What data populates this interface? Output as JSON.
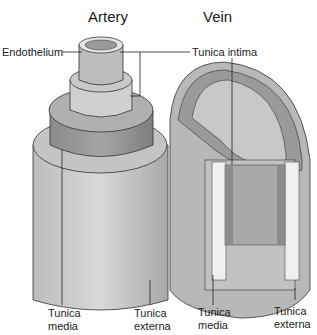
{
  "titles": {
    "artery": "Artery",
    "vein": "Vein"
  },
  "labels": {
    "endothelium": "Endothelium",
    "tunica_intima": "Tunica intima",
    "artery_media": [
      "Tunica",
      "media"
    ],
    "artery_externa": [
      "Tunica",
      "externa"
    ],
    "vein_media": [
      "Tunica",
      "media"
    ],
    "vein_externa": [
      "Tunica",
      "externa"
    ]
  }
}
